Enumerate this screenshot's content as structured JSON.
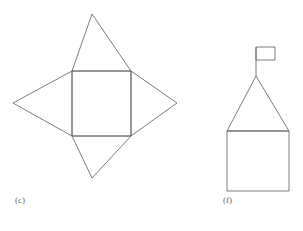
{
  "page": {
    "background_color": "#ffffff",
    "stroke_color": "#5a5a5a",
    "label_color": "#6a6a6a",
    "width": 303,
    "height": 231
  },
  "figures": [
    {
      "id": "c",
      "label": "(c)",
      "name": "square-with-four-triangles-net",
      "description": "Central square with an isosceles triangle attached to each of its four sides, forming a four-pointed star",
      "square": {
        "left": 72,
        "top": 71,
        "right": 131,
        "bottom": 136
      },
      "apexes": {
        "top": {
          "x": 92,
          "y": 14
        },
        "bottom": {
          "x": 92,
          "y": 178
        },
        "left": {
          "x": 13,
          "y": 103
        },
        "right": {
          "x": 177,
          "y": 103
        }
      }
    },
    {
      "id": "f",
      "label": "(f)",
      "name": "house-with-flag-figure",
      "description": "Square base topped by a triangular roof with a flagpole and rectangular flag rising from the apex",
      "square": {
        "left": 227,
        "top": 131,
        "right": 289,
        "bottom": 191
      },
      "roof_apex": {
        "x": 256,
        "y": 76
      },
      "pole": {
        "x": 256,
        "top": 47,
        "bottom": 76
      },
      "flag": {
        "left": 256,
        "top": 47,
        "right": 275,
        "bottom": 60
      }
    }
  ],
  "labels": {
    "figure_c": "(c)",
    "figure_f": "(f)"
  }
}
